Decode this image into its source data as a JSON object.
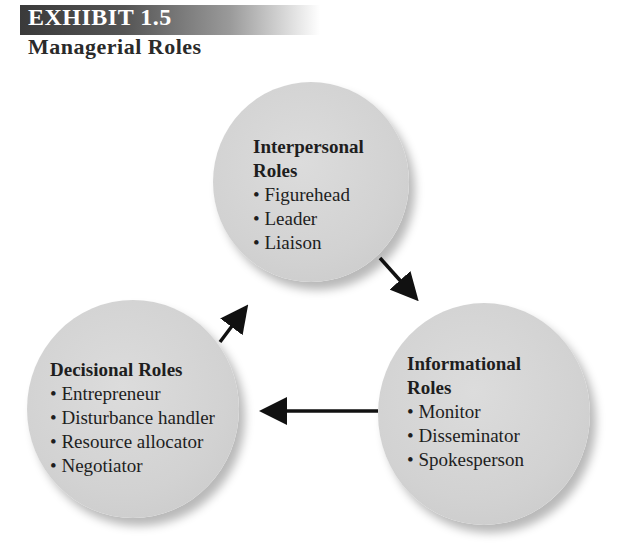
{
  "header": {
    "exhibit_label": "EXHIBIT 1.5",
    "title": "Managerial Roles"
  },
  "roles": [
    {
      "heading_line1": "Interpersonal",
      "heading_line2": "Roles",
      "items": [
        "Figurehead",
        "Leader",
        "Liaison"
      ]
    },
    {
      "heading_line1": "Informational",
      "heading_line2": "Roles",
      "items": [
        "Monitor",
        "Disseminator",
        "Spokesperson"
      ]
    },
    {
      "heading_line1": "Decisional Roles",
      "heading_line2": "",
      "items": [
        "Entrepreneur",
        "Disturbance handler",
        "Resource allocator",
        "Negotiator"
      ]
    }
  ],
  "flow": [
    {
      "from": "Decisional Roles",
      "to": "Interpersonal Roles"
    },
    {
      "from": "Interpersonal Roles",
      "to": "Informational Roles"
    },
    {
      "from": "Informational Roles",
      "to": "Decisional Roles"
    }
  ],
  "colors": {
    "circle_fill": "#d4d4d4",
    "arrow": "#111111",
    "banner_dark": "#3a3a3a"
  }
}
